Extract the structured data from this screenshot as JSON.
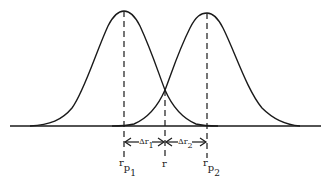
{
  "diagram": {
    "labels": {
      "peak1": {
        "main": "r",
        "sub": "p",
        "subsub": "1"
      },
      "peak2": {
        "main": "r",
        "sub": "p",
        "subsub": "2"
      },
      "crossing": "r",
      "delta1": {
        "main": "Δr",
        "sub": "1"
      },
      "delta2": {
        "main": "Δr",
        "sub": "2"
      }
    },
    "colors": {
      "line": "#1a1a1a",
      "background": "#ffffff"
    }
  }
}
